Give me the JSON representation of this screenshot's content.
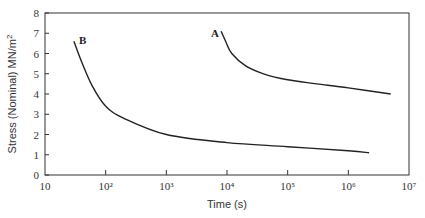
{
  "chart_data": {
    "type": "line",
    "title": "",
    "xlabel": "Time (s)",
    "ylabel": "Stress (Nominal) MN/m²",
    "xscale": "log",
    "xlim": [
      10,
      10000000
    ],
    "ylim": [
      0,
      8
    ],
    "grid": false,
    "legend": "none (curves labelled directly)",
    "x_tick_labels": [
      "10",
      "10²",
      "10³",
      "10⁴",
      "10⁵",
      "10⁶",
      "10⁷"
    ],
    "y_tick_labels": [
      "0",
      "1",
      "2",
      "3",
      "4",
      "5",
      "6",
      "7",
      "8"
    ],
    "series": [
      {
        "name": "A",
        "points": [
          [
            8000,
            7.1
          ],
          [
            9500,
            6.6
          ],
          [
            12000,
            6.0
          ],
          [
            20000,
            5.4
          ],
          [
            40000,
            5.0
          ],
          [
            100000,
            4.7
          ],
          [
            300000,
            4.5
          ],
          [
            1000000,
            4.3
          ],
          [
            5000000,
            4.0
          ]
        ]
      },
      {
        "name": "B",
        "points": [
          [
            30,
            6.6
          ],
          [
            40,
            5.6
          ],
          [
            60,
            4.4
          ],
          [
            100,
            3.4
          ],
          [
            200,
            2.8
          ],
          [
            1000,
            2.0
          ],
          [
            10000,
            1.6
          ],
          [
            100000,
            1.4
          ],
          [
            1000000,
            1.2
          ],
          [
            2200000,
            1.1
          ]
        ]
      }
    ]
  },
  "labels": {
    "x_axis_title": "Time (s)",
    "y_axis_title": "Stress (Nominal) MN/m²",
    "curve_a": "A",
    "curve_b": "B",
    "x_ticks": [
      "10",
      "10²",
      "10³",
      "10⁴",
      "10⁵",
      "10⁶",
      "10⁷"
    ],
    "y_ticks": [
      "0",
      "1",
      "2",
      "3",
      "4",
      "5",
      "6",
      "7",
      "8"
    ]
  }
}
